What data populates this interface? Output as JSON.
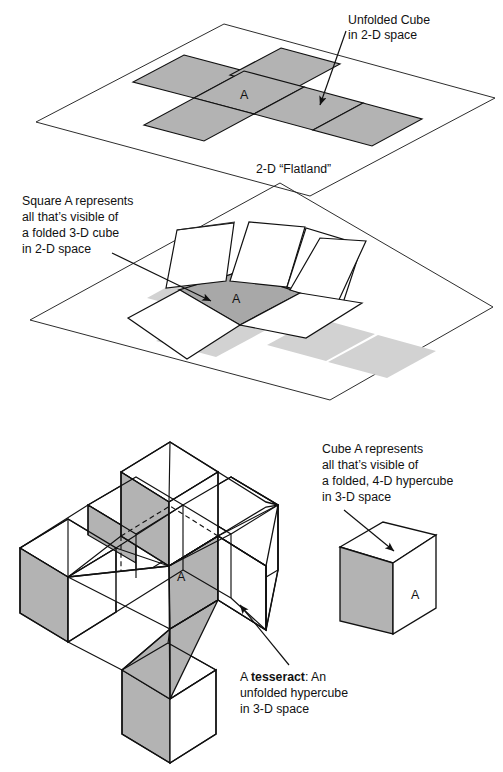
{
  "figure": {
    "colors": {
      "ink": "#111111",
      "paper": "#ffffff",
      "gray_face": "#b3b3b3",
      "gray_face_dark": "#a8a8a8",
      "gray_shadow": "#d2d2d2",
      "white_face": "#ffffff"
    }
  },
  "panel1": {
    "name": "flatland-unfolded-cube",
    "callout": {
      "line1": "Unfolded Cube",
      "line2": "in 2-D space"
    },
    "plane_label": "2-D “Flatland”",
    "square_label": "A"
  },
  "panel2": {
    "name": "flatland-folded-cube",
    "callout": {
      "line1": "Square A represents",
      "line2": "all that’s visible of",
      "line3": "a folded 3-D cube",
      "line4": "in 2-D space"
    },
    "square_label": "A"
  },
  "panel3": {
    "name": "tesseract-unfolded-hypercube",
    "callout": {
      "line1_prefix": "A ",
      "line1_bold": "tesseract",
      "line1_suffix": ": An",
      "line2": "unfolded hypercube",
      "line3": "in 3-D space"
    },
    "cube_label": "A"
  },
  "panel4": {
    "name": "folded-hypercube-cube-a",
    "callout": {
      "line1": "Cube A represents",
      "line2": "all that’s visible of",
      "line3": "a folded, 4-D hypercube",
      "line4": "in 3-D space"
    },
    "cube_label": "A"
  }
}
